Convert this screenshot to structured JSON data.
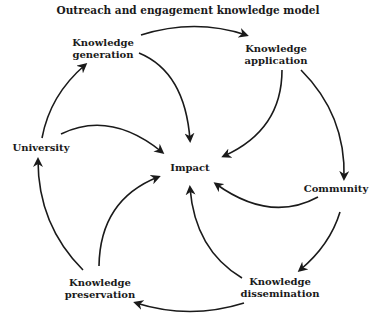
{
  "title": "Outreach and engagement knowledge model",
  "nodes": {
    "generation": {
      "line1": "Knowledge",
      "line2": "generation"
    },
    "application": {
      "line1": "Knowledge",
      "line2": "application"
    },
    "university": {
      "label": "University"
    },
    "impact": {
      "label": "Impact"
    },
    "community": {
      "label": "Community"
    },
    "preservation": {
      "line1": "Knowledge",
      "line2": "preservation"
    },
    "dissemination": {
      "line1": "Knowledge",
      "line2": "dissemination"
    }
  },
  "edges": [
    {
      "from": "Knowledge generation",
      "to": "Knowledge application"
    },
    {
      "from": "Knowledge generation",
      "to": "Impact"
    },
    {
      "from": "Knowledge application",
      "to": "Impact"
    },
    {
      "from": "Knowledge application",
      "to": "Community"
    },
    {
      "from": "Community",
      "to": "Impact"
    },
    {
      "from": "Community",
      "to": "Knowledge dissemination"
    },
    {
      "from": "Knowledge dissemination",
      "to": "Impact"
    },
    {
      "from": "Knowledge dissemination",
      "to": "Knowledge preservation"
    },
    {
      "from": "Knowledge preservation",
      "to": "Impact"
    },
    {
      "from": "Knowledge preservation",
      "to": "University"
    },
    {
      "from": "University",
      "to": "Knowledge generation"
    },
    {
      "from": "University",
      "to": "Impact"
    }
  ],
  "colors": {
    "stroke": "#1a1a1a",
    "background": "#ffffff"
  }
}
